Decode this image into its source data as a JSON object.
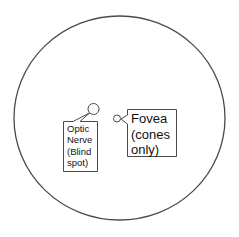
{
  "diagram": {
    "colors": {
      "stroke": "#4a4a4a",
      "background": "#ffffff",
      "text": "#111111"
    },
    "eye_outline": {
      "shape": "circle"
    },
    "callouts": [
      {
        "id": "optic-nerve",
        "lines": [
          "Optic",
          "Nerve",
          "(Blind",
          "spot)"
        ],
        "text": "Optic\nNerve\n(Blind\nspot)"
      },
      {
        "id": "fovea",
        "lines": [
          "Fovea",
          "(cones",
          "only)"
        ],
        "text": "Fovea\n(cones\nonly)"
      }
    ]
  }
}
